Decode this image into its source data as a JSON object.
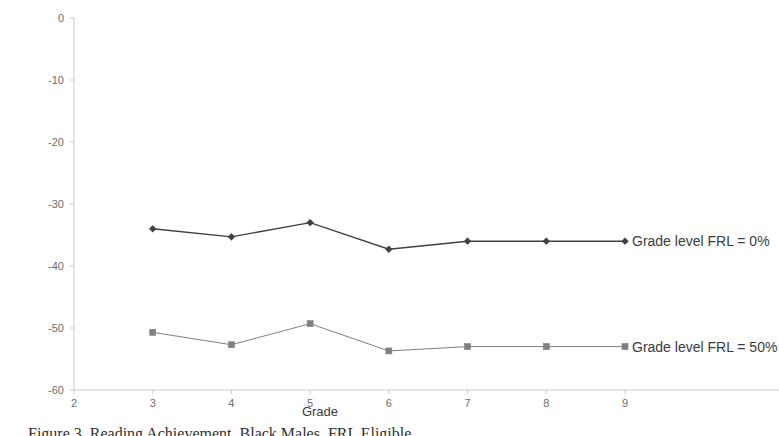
{
  "chart_data": {
    "type": "line",
    "title": "",
    "xlabel": "Grade",
    "ylabel": "Cumulative Effect on Achievement",
    "x": [
      3,
      4,
      5,
      6,
      7,
      8
    ],
    "xlim": [
      2,
      9
    ],
    "ylim": [
      -60,
      0
    ],
    "xticks": [
      2,
      3,
      4,
      5,
      6,
      7,
      8,
      9
    ],
    "xtick_labels": [
      "2",
      "3",
      "4",
      "5",
      "6",
      "7",
      "8",
      "9"
    ],
    "yticks": [
      0,
      -10,
      -20,
      -30,
      -40,
      -50,
      -60
    ],
    "ytick_labels": [
      "0",
      "-10",
      "-20",
      "-30",
      "-40",
      "-50",
      "-60"
    ],
    "grid": false,
    "legend_position": "right-inline",
    "series": [
      {
        "name": "Grade level FRL = 0%",
        "values": [
          -34.0,
          -35.3,
          -33.0,
          -37.3,
          -36.0,
          -36.0
        ],
        "color": "#404040",
        "marker": "diamond"
      },
      {
        "name": "Grade level FRL = 50%",
        "values": [
          -50.7,
          -52.7,
          -49.3,
          -53.7,
          -53.0,
          -53.0
        ],
        "color": "#808080",
        "marker": "square"
      }
    ]
  },
  "axes": {
    "y_title": "Cumulative Effect on Achievement",
    "x_title": "Grade"
  },
  "legend": {
    "series_0_label": "Grade level FRL = 0%",
    "series_1_label": "Grade level FRL = 50%"
  },
  "caption": {
    "text": "Figure 3.  Reading Achievement, Black Males, FRL Eligible"
  }
}
